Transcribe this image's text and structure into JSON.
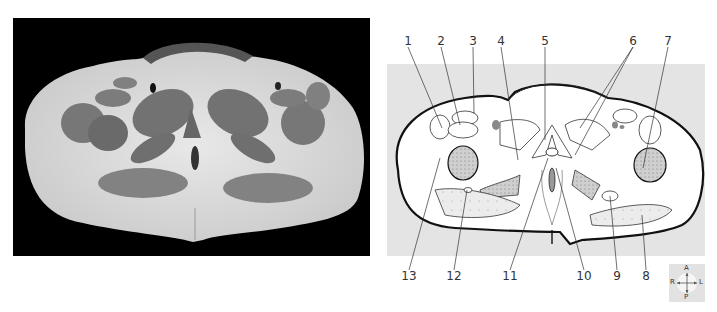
{
  "figure": {
    "photo_panel": {
      "description": "Axial cross-section photograph of pelvis (grayscale, black background)",
      "background": "#000000"
    },
    "diagram_panel": {
      "description": "Line drawing of the same pelvic cross-section with numbered leader lines",
      "background": "#e4e4e4",
      "outline_color": "#111111",
      "stipple_color": "#9a9a9a"
    },
    "labels_top": [
      {
        "id": "1",
        "text": "1"
      },
      {
        "id": "2",
        "text": "2"
      },
      {
        "id": "3",
        "text": "3"
      },
      {
        "id": "4",
        "text": "4"
      },
      {
        "id": "5",
        "text": "5"
      },
      {
        "id": "6",
        "text": "6"
      },
      {
        "id": "7",
        "text": "7"
      }
    ],
    "labels_bottom": [
      {
        "id": "13",
        "text": "13"
      },
      {
        "id": "12",
        "text": "12"
      },
      {
        "id": "11",
        "text": "11"
      },
      {
        "id": "10",
        "text": "10"
      },
      {
        "id": "9",
        "text": "9"
      },
      {
        "id": "8",
        "text": "8"
      }
    ],
    "orientation_compass": {
      "anterior": "A",
      "posterior": "P",
      "right": "R",
      "left": "L",
      "icon": "compass-cross-icon"
    }
  }
}
